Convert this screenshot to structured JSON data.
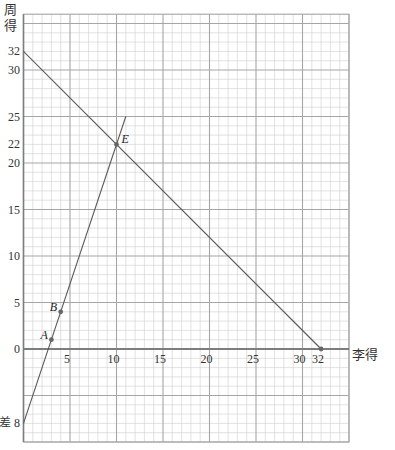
{
  "chart_data": {
    "type": "line",
    "title": "",
    "xlabel": "李得",
    "ylabel": "周得",
    "xlim": [
      0,
      35
    ],
    "ylim": [
      -10,
      36
    ],
    "grid": true,
    "minor_grid_step": 1,
    "major_grid_step": 5,
    "x_ticks": [
      5,
      10,
      15,
      20,
      25,
      30,
      32
    ],
    "y_ticks": [
      0,
      5,
      10,
      15,
      20,
      22,
      25,
      30,
      32
    ],
    "y_extra_labels": [
      {
        "value": -8,
        "text": "差 8"
      }
    ],
    "series": [
      {
        "name": "steep-line",
        "equation": "y = 3x - 8",
        "points": [
          [
            0,
            -8
          ],
          [
            11,
            25
          ]
        ]
      },
      {
        "name": "falling-line",
        "equation": "y = 32 - x",
        "points": [
          [
            0,
            32
          ],
          [
            32,
            0
          ]
        ]
      }
    ],
    "labeled_points": [
      {
        "label": "A",
        "x": 3,
        "y": 1,
        "side": "left"
      },
      {
        "label": "B",
        "x": 4,
        "y": 4,
        "side": "left"
      },
      {
        "label": "E",
        "x": 10,
        "y": 22,
        "side": "right"
      }
    ],
    "marked_points": [
      {
        "x": 32,
        "y": 0
      }
    ],
    "colors": {
      "minor_grid": "#cfcfcf",
      "major_grid": "#a6a6a6",
      "axis": "#7d7d7d",
      "line": "#5a5a5a",
      "dot": "#666666"
    }
  }
}
